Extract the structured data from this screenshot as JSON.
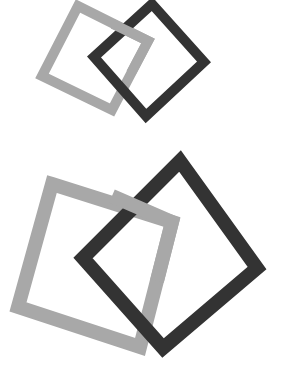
{
  "canvas": {
    "width": 283,
    "height": 374,
    "background_color": "#ffffff",
    "title": "Interlocking squares logo mark"
  },
  "palette": {
    "gray": "#a8a8a8",
    "dark": "#333333",
    "background": "#ffffff"
  },
  "marks": [
    {
      "id": "mark-top",
      "name": "small-interlocking-squares",
      "shapes": [
        {
          "id": "top-gray-square",
          "name": "gray-square",
          "color": "#a8a8a8",
          "stroke_width": 10,
          "points": "78,6 148,41 112,110 42,76",
          "z": 1
        },
        {
          "id": "top-dark-square",
          "name": "dark-square",
          "color": "#333333",
          "stroke_width": 10,
          "points": "152,4 204,62 146,116 94,57",
          "z": 2
        }
      ]
    },
    {
      "id": "mark-bottom",
      "name": "large-interlocking-squares",
      "shapes": [
        {
          "id": "bottom-gray-square",
          "name": "gray-square",
          "color": "#a8a8a8",
          "stroke_width": 14,
          "points": "52,184 172,222 140,347 18,307",
          "z": 1
        },
        {
          "id": "bottom-dark-square",
          "name": "dark-square",
          "color": "#333333",
          "stroke_width": 14,
          "points": "180,161 257,268 163,348 83,258",
          "z": 2
        }
      ]
    }
  ],
  "overlaps": [
    {
      "id": "top-overlap-gray-over-dark",
      "name": "gray-over-dark-weave-segment",
      "color": "#a8a8a8",
      "stroke_width": 10,
      "points": "113,24 148,41 131,73",
      "belongs_to": "top-gray-square"
    },
    {
      "id": "bottom-overlap-gray-over-dark",
      "name": "gray-over-dark-weave-segment",
      "color": "#a8a8a8",
      "stroke_width": 14,
      "points": "112,196 172,222 157,281",
      "belongs_to": "bottom-gray-square"
    }
  ]
}
